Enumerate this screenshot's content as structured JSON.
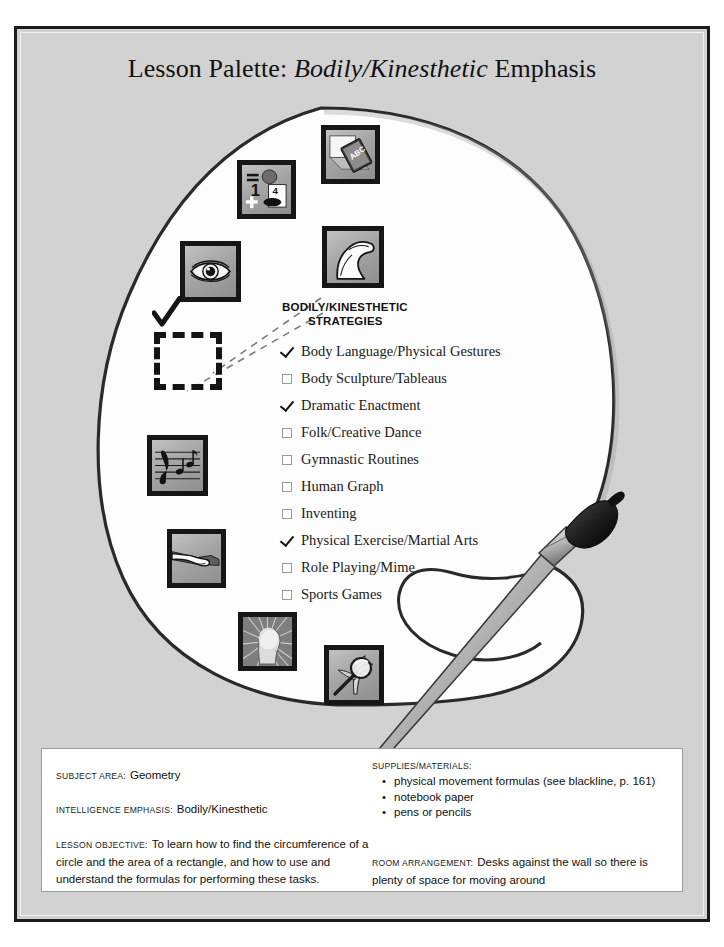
{
  "page": {
    "title_prefix": "Lesson Palette: ",
    "title_emphasis": "Bodily/Kinesthetic",
    "title_suffix": " Emphasis",
    "background_color": "#d3d3d3",
    "frame_color": "#1b1b1b",
    "palette_fill": "#ffffff"
  },
  "palette": {
    "tiles": [
      {
        "name": "logical-mathematical",
        "icon": "math-symbols-icon",
        "x": 237,
        "y": 160,
        "size": 59
      },
      {
        "name": "verbal-linguistic",
        "icon": "abc-book-icon",
        "x": 321,
        "y": 125,
        "size": 59
      },
      {
        "name": "visual-spatial",
        "icon": "eye-icon",
        "x": 180,
        "y": 241,
        "size": 61
      },
      {
        "name": "bodily-kinesthetic",
        "icon": "flexed-arm-icon",
        "x": 322,
        "y": 226,
        "size": 62
      },
      {
        "name": "musical-rhythmic",
        "icon": "music-staff-icon",
        "x": 147,
        "y": 435,
        "size": 61
      },
      {
        "name": "interpersonal",
        "icon": "handshake-icon",
        "x": 167,
        "y": 529,
        "size": 59
      },
      {
        "name": "intrapersonal",
        "icon": "radiant-head-icon",
        "x": 238,
        "y": 612,
        "size": 59
      },
      {
        "name": "naturalist",
        "icon": "magnifier-leaf-icon",
        "x": 324,
        "y": 645,
        "size": 60
      }
    ]
  },
  "strategies": {
    "heading_line1": "BODILY/KINESTHETIC",
    "heading_line2": "STRATEGIES",
    "items": [
      {
        "label": "Body Language/Physical Gestures",
        "checked": true
      },
      {
        "label": "Body Sculpture/Tableaus",
        "checked": false
      },
      {
        "label": "Dramatic Enactment",
        "checked": true
      },
      {
        "label": "Folk/Creative Dance",
        "checked": false
      },
      {
        "label": "Gymnastic Routines",
        "checked": false
      },
      {
        "label": "Human Graph",
        "checked": false
      },
      {
        "label": "Inventing",
        "checked": false
      },
      {
        "label": "Physical Exercise/Martial Arts",
        "checked": true
      },
      {
        "label": "Role Playing/Mime",
        "checked": false
      },
      {
        "label": "Sports Games",
        "checked": false
      }
    ]
  },
  "info": {
    "subject_label": "SUBJECT AREA:",
    "subject_value": "Geometry",
    "emphasis_label": "INTELLIGENCE EMPHASIS:",
    "emphasis_value": "Bodily/Kinesthetic",
    "objective_label": "LESSON OBJECTIVE:",
    "objective_value": "To learn how to find the circumference of a circle and the area of a rectangle, and how to use and understand the formulas for performing these tasks.",
    "supplies_label": "SUPPLIES/MATERIALS:",
    "supplies_items": [
      "physical movement formulas (see blackline, p. 161)",
      "notebook paper",
      "pens or pencils"
    ],
    "room_label": "ROOM ARRANGEMENT:",
    "room_value": "Desks against the wall so there is plenty of space for moving around"
  }
}
